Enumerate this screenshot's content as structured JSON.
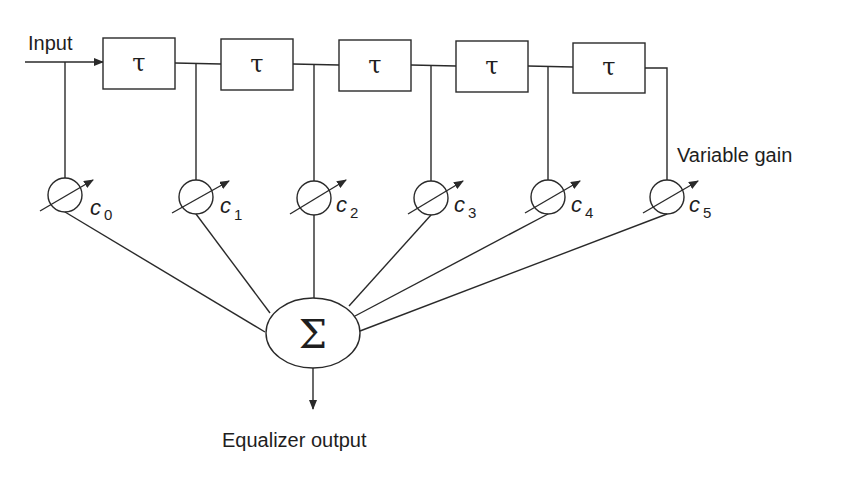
{
  "labels": {
    "input": "Input",
    "variable_gain": "Variable gain",
    "output": "Equalizer output",
    "delay_symbol": "τ",
    "sum_symbol": "Σ"
  },
  "delays": [
    {
      "label": "τ"
    },
    {
      "label": "τ"
    },
    {
      "label": "τ"
    },
    {
      "label": "τ"
    },
    {
      "label": "τ"
    }
  ],
  "taps": [
    {
      "coef": "c",
      "sub": "0"
    },
    {
      "coef": "c",
      "sub": "1"
    },
    {
      "coef": "c",
      "sub": "2"
    },
    {
      "coef": "c",
      "sub": "3"
    },
    {
      "coef": "c",
      "sub": "4"
    },
    {
      "coef": "c",
      "sub": "5"
    }
  ],
  "colors": {
    "stroke": "#2a2a2a",
    "background": "#ffffff"
  }
}
